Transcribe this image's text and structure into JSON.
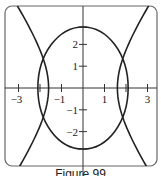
{
  "caption": "Figure 99",
  "chart_data": {
    "type": "line",
    "title": "",
    "xlabel": "",
    "ylabel": "",
    "xlim": [
      -3.5,
      3.4
    ],
    "ylim": [
      -3.6,
      3.8
    ],
    "grid": false,
    "legend": null,
    "x_ticks": [
      -3,
      -2,
      -1,
      1,
      2,
      3
    ],
    "x_tick_labels": [
      "-3",
      "",
      "-1",
      "1",
      "",
      "3"
    ],
    "y_ticks": [
      2,
      1,
      -1,
      -2
    ],
    "y_tick_labels": [
      "2",
      "1",
      "-1",
      "-2"
    ],
    "series": [
      {
        "name": "ellipse",
        "shape": "ellipse",
        "center": [
          0,
          0
        ],
        "semi_axis_x": 2.1,
        "semi_axis_y": 2.8
      },
      {
        "name": "hyperbola",
        "shape": "hyperbola (opens left/right)",
        "vertex_x": 1.6,
        "asymptote_slope": 1.45
      }
    ],
    "intersections": [
      [
        1.95,
        1.15
      ],
      [
        1.95,
        -1.15
      ],
      [
        -1.95,
        1.15
      ],
      [
        -1.95,
        -1.15
      ]
    ]
  },
  "plot": {
    "origin_px": [
      83,
      88
    ],
    "unit_px_x": 21.5,
    "unit_px_y": 21.8,
    "frame": {
      "left": 5,
      "top": 6,
      "right": 157,
      "bottom": 166,
      "corner_radius": 7
    },
    "line_color": "#222222",
    "axis_color": "#333333"
  }
}
